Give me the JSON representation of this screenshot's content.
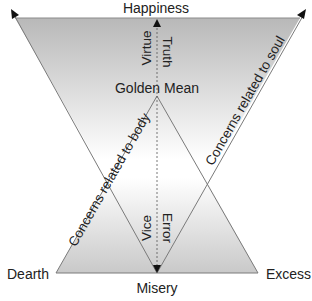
{
  "diagram": {
    "top_label": "Happiness",
    "bottom_label": "Misery",
    "left_label": "Dearth",
    "right_label": "Excess",
    "center_label": "Golden Mean",
    "upper_left_axis_label": "Virtue",
    "upper_right_axis_label": "Truth",
    "lower_left_axis_label": "Vice",
    "lower_right_axis_label": "Error",
    "body_line_label": "Concerns related to body",
    "soul_line_label": "Concerns related to soul"
  },
  "colors": {
    "top_fill": "#b8b8b8",
    "bottom_fill": "#c9c9c9",
    "line": "#7a7a7a",
    "text": "#222222"
  }
}
